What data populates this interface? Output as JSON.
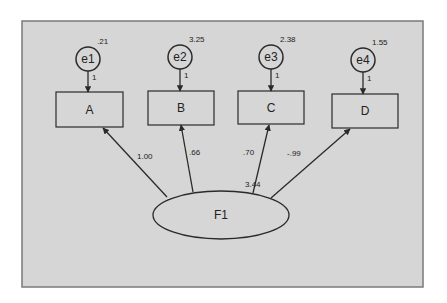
{
  "diagram": {
    "type": "path-diagram",
    "colors": {
      "canvas_bg": "#d6d6d6",
      "frame_border": "#7a7a7a",
      "stroke": "#2a2a2a",
      "page_bg": "#ffffff"
    },
    "latent": {
      "id": "F1",
      "label": "F1",
      "variance": "3.44",
      "cx": 221,
      "cy": 215,
      "rx": 68,
      "ry": 24
    },
    "indicators": [
      {
        "id": "A",
        "label": "A",
        "x": 56,
        "y": 92,
        "w": 67,
        "h": 35,
        "loading": "1.00",
        "error": {
          "label": "e1",
          "variance": ".21",
          "path": "1",
          "cx": 88,
          "cy": 59
        }
      },
      {
        "id": "B",
        "label": "B",
        "x": 148,
        "y": 91,
        "w": 66,
        "h": 34,
        "loading": ".66",
        "error": {
          "label": "e2",
          "variance": "3.25",
          "path": "1",
          "cx": 180,
          "cy": 57
        }
      },
      {
        "id": "C",
        "label": "C",
        "x": 238,
        "y": 91,
        "w": 66,
        "h": 33,
        "loading": ".70",
        "error": {
          "label": "e3",
          "variance": "2.38",
          "path": "1",
          "cx": 271,
          "cy": 57
        }
      },
      {
        "id": "D",
        "label": "D",
        "x": 332,
        "y": 94,
        "w": 66,
        "h": 34,
        "loading": "-.99",
        "error": {
          "label": "e4",
          "variance": "1.55",
          "path": "1",
          "cx": 363,
          "cy": 60
        }
      }
    ],
    "paths": [
      {
        "from": "F1",
        "to": "A",
        "x1": 167,
        "y1": 197,
        "x2": 103,
        "y2": 128,
        "label": "1.00",
        "lx": 137,
        "ly": 159
      },
      {
        "from": "F1",
        "to": "B",
        "x1": 193,
        "y1": 192,
        "x2": 181,
        "y2": 125,
        "label": ".66",
        "lx": 189,
        "ly": 155
      },
      {
        "from": "F1",
        "to": "C",
        "x1": 253,
        "y1": 193,
        "x2": 269,
        "y2": 125,
        "label": ".70",
        "lx": 243,
        "ly": 155
      },
      {
        "from": "F1",
        "to": "D",
        "x1": 271,
        "y1": 198,
        "x2": 350,
        "y2": 129,
        "label": "-.99",
        "lx": 287,
        "ly": 156
      }
    ]
  }
}
